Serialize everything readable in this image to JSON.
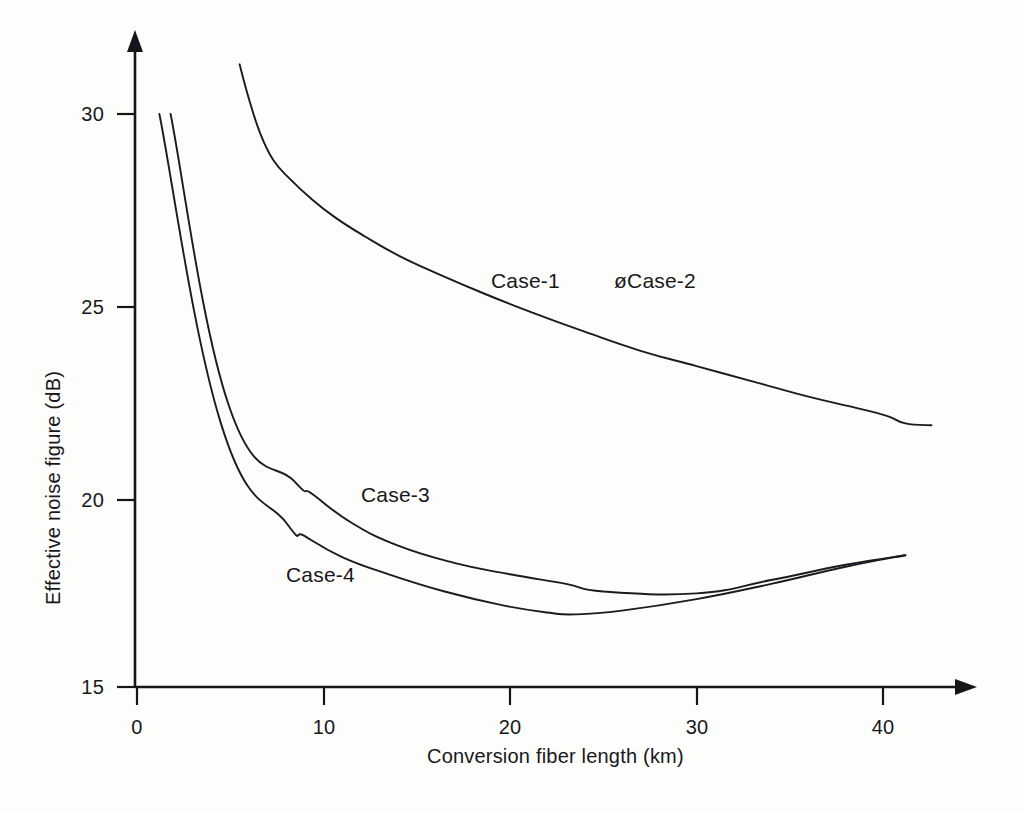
{
  "chart_data": {
    "type": "line",
    "title": "",
    "xlabel": "Conversion fiber length (km)",
    "ylabel": "Effective noise figure (dB)",
    "xlim": [
      0,
      45
    ],
    "ylim": [
      15,
      32
    ],
    "xticks": [
      "0",
      "10",
      "20",
      "30",
      "40"
    ],
    "xtick_values": [
      0,
      10,
      20,
      30,
      40
    ],
    "yticks": [
      "15",
      "20",
      "25",
      "30"
    ],
    "ytick_values": [
      15,
      20,
      25,
      30
    ],
    "grid": false,
    "legend_position": "inline-annotations",
    "axis_style": "arrow-terminated",
    "series": [
      {
        "name": "Case-1",
        "label": "Case-1",
        "color": "#1b1b1f",
        "x": [
          5.5,
          6.0,
          6.6,
          7.3,
          8.2,
          9.3,
          10.6,
          12.2,
          14.0,
          16.2,
          18.6,
          21.2,
          24.0,
          27.0,
          30.0,
          33.0,
          36.0,
          38.6,
          40.2,
          41.2,
          42.6
        ],
        "y": [
          31.3,
          30.4,
          29.5,
          28.8,
          28.3,
          27.8,
          27.3,
          26.8,
          26.3,
          25.8,
          25.3,
          24.8,
          24.3,
          23.8,
          23.4,
          23.0,
          22.6,
          22.3,
          22.1,
          21.9,
          21.85
        ]
      },
      {
        "name": "Case-2",
        "label": "øCase-2",
        "color": "#1b1b1f",
        "x": [],
        "y": [],
        "note": "label-only annotation, overlaps Case-1 trace"
      },
      {
        "name": "Case-3",
        "label": "Case-3",
        "color": "#1b1b1f",
        "x": [
          1.8,
          4.9,
          8.4,
          9.4,
          11.5,
          14.0,
          17.0,
          20.0,
          23.0,
          25.0,
          30.0,
          34.0,
          38.0,
          41.2
        ],
        "y": [
          30.0,
          22.4,
          20.4,
          20.05,
          19.3,
          18.7,
          18.25,
          17.95,
          17.7,
          17.5,
          17.45,
          17.8,
          18.2,
          18.45
        ]
      },
      {
        "name": "Case-4",
        "label": "Case-4",
        "color": "#1b1b1f",
        "x": [
          1.2,
          4.5,
          8.0,
          9.0,
          11.0,
          13.5,
          16.5,
          19.5,
          22.0,
          23.5,
          26.0,
          30.0,
          34.0,
          38.0,
          41.2
        ],
        "y": [
          30.0,
          21.9,
          19.3,
          18.95,
          18.4,
          17.95,
          17.5,
          17.15,
          16.95,
          16.9,
          17.0,
          17.3,
          17.7,
          18.15,
          18.45
        ]
      }
    ],
    "annotations": [
      {
        "text": "Case-1",
        "x": 19.0,
        "y": 25.6
      },
      {
        "text": "øCase-2",
        "x": 25.6,
        "y": 25.6
      },
      {
        "text": "Case-3",
        "x": 12.0,
        "y": 20.0
      },
      {
        "text": "Case-4",
        "x": 8.0,
        "y": 17.9
      }
    ]
  }
}
